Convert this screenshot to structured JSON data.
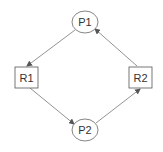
{
  "diagram": {
    "type": "resource-allocation-graph",
    "nodes": [
      {
        "id": "P1",
        "label": "P1",
        "shape": "ellipse",
        "cx": 85,
        "cy": 22,
        "rx": 13,
        "ry": 11
      },
      {
        "id": "R1",
        "label": "R1",
        "shape": "rect",
        "x": 15,
        "y": 67,
        "w": 23,
        "h": 21
      },
      {
        "id": "R2",
        "label": "R2",
        "shape": "rect",
        "x": 129,
        "y": 67,
        "w": 23,
        "h": 21
      },
      {
        "id": "P2",
        "label": "P2",
        "shape": "ellipse",
        "cx": 85,
        "cy": 130,
        "rx": 13,
        "ry": 11
      }
    ],
    "edges": [
      {
        "from": "P1",
        "to": "R1"
      },
      {
        "from": "R1",
        "to": "P2"
      },
      {
        "from": "P2",
        "to": "R2"
      },
      {
        "from": "R2",
        "to": "P1"
      }
    ],
    "colors": {
      "stroke": "#666666",
      "text": "#333333",
      "background": "#ffffff"
    }
  }
}
